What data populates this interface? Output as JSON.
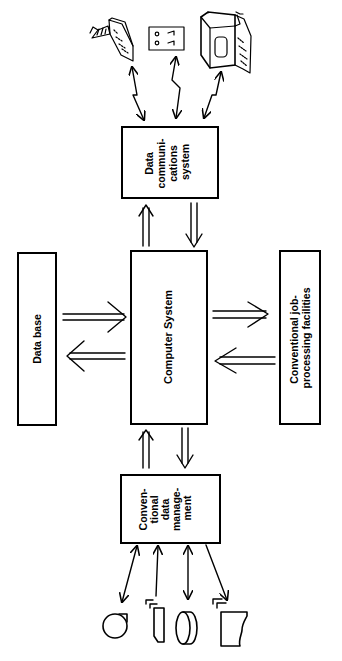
{
  "diagram": {
    "orientation": "rotated-90-ccw",
    "nodes": {
      "data_comms": {
        "lines": [
          "Data",
          "communi-",
          "cations",
          "system"
        ]
      },
      "computer": {
        "lines": [
          "Computer System"
        ]
      },
      "database": {
        "lines": [
          "Data base"
        ]
      },
      "job_processing": {
        "lines": [
          "Conventional job-",
          "processing facilities"
        ]
      },
      "data_mgmt": {
        "lines": [
          "Conven-",
          "tional",
          "data",
          "manage-",
          "ment"
        ]
      }
    },
    "terminals": [
      "teleprinter-terminal",
      "card-reader-terminal",
      "video-display-terminal"
    ],
    "storage_devices": [
      "magnetic-tape",
      "card-deck",
      "magnetic-disk",
      "printed-report"
    ],
    "edges": [
      {
        "from": "terminals",
        "to": "data_comms",
        "type": "zigzag-bidirectional"
      },
      {
        "from": "data_comms",
        "to": "computer",
        "type": "double-arrow-pair"
      },
      {
        "from": "database",
        "to": "computer",
        "type": "double-arrow-pair"
      },
      {
        "from": "computer",
        "to": "job_processing",
        "type": "double-arrow-pair"
      },
      {
        "from": "computer",
        "to": "data_mgmt",
        "type": "double-arrow-pair"
      },
      {
        "from": "data_mgmt",
        "to": "storage_devices",
        "type": "single-arrows"
      }
    ]
  }
}
